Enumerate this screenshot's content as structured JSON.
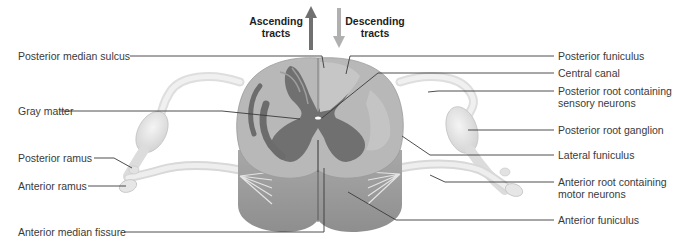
{
  "diagram": {
    "colors": {
      "background": "#ffffff",
      "white_matter": "#b4b4b4",
      "white_matter_light": "#c8c8c8",
      "gray_matter": "#707070",
      "outer_side": "#a0a0a0",
      "nerve_root": "#e6e6e6",
      "leader_line": "#3a3a3a",
      "label_text": "#3a3a3a",
      "ascending_arrow": "#707070",
      "descending_arrow": "#b0b0b0"
    },
    "arrows": {
      "ascending": {
        "label_line1": "Ascending",
        "label_line2": "tracts",
        "direction": "up"
      },
      "descending": {
        "label_line1": "Descending",
        "label_line2": "tracts",
        "direction": "down"
      }
    },
    "labels_left": [
      {
        "id": "posterior-median-sulcus",
        "text": "Posterior median sulcus"
      },
      {
        "id": "gray-matter",
        "text": "Gray matter"
      },
      {
        "id": "posterior-ramus",
        "text": "Posterior ramus"
      },
      {
        "id": "anterior-ramus",
        "text": "Anterior ramus"
      },
      {
        "id": "anterior-median-fissure",
        "text": "Anterior median fissure"
      }
    ],
    "labels_right": [
      {
        "id": "posterior-funiculus",
        "text": "Posterior funiculus"
      },
      {
        "id": "central-canal",
        "text": "Central canal"
      },
      {
        "id": "posterior-root",
        "line1": "Posterior root containing",
        "line2": "sensory neurons"
      },
      {
        "id": "posterior-root-ganglion",
        "text": "Posterior root ganglion"
      },
      {
        "id": "lateral-funiculus",
        "text": "Lateral funiculus"
      },
      {
        "id": "anterior-root",
        "line1": "Anterior root containing",
        "line2": "motor neurons"
      },
      {
        "id": "anterior-funiculus",
        "text": "Anterior funiculus"
      }
    ]
  }
}
